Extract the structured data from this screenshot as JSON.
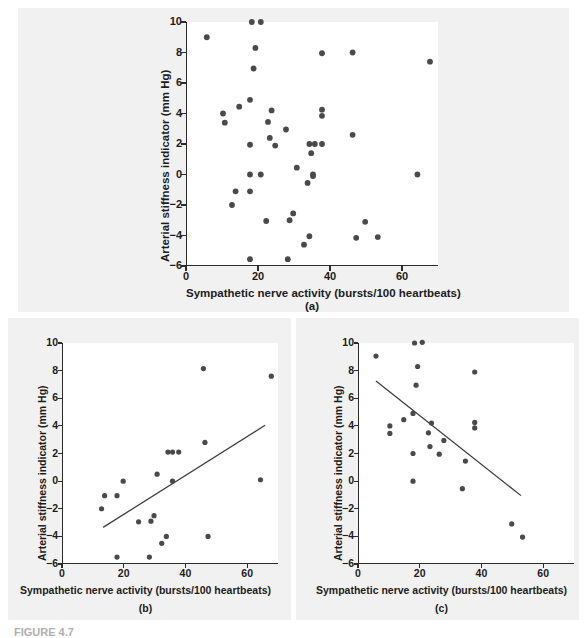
{
  "figure": {
    "caption_label": "FIGURE 4.7",
    "caption_text": "",
    "background_color": "#f1f1f1",
    "plot_background_color": "#ffffff",
    "point_color": "#4a4a4a",
    "axis_color": "#2b2b2b",
    "line_color": "#3a3a3a"
  },
  "axis_titles": {
    "x": "Sympathetic nerve activity (bursts/100 heartbeats)",
    "y": "Arterial stiffness indicator (mm Hg)"
  },
  "ticks": {
    "x": [
      "0",
      "20",
      "40",
      "60"
    ],
    "y": [
      "10",
      "8",
      "6",
      "4",
      "2",
      "0",
      "−2",
      "−4",
      "−6"
    ]
  },
  "panels": [
    {
      "id": "a",
      "letter": "(a)"
    },
    {
      "id": "b",
      "letter": "(b)"
    },
    {
      "id": "c",
      "letter": "(c)"
    }
  ],
  "chart_data": [
    {
      "type": "scatter",
      "panel": "(a)",
      "title": "",
      "xlabel": "Sympathetic nerve activity (bursts/100 heartbeats)",
      "ylabel": "Arterial stiffness indicator (mm Hg)",
      "xlim": [
        0,
        70
      ],
      "ylim": [
        -6,
        10
      ],
      "xticks": [
        0,
        20,
        40,
        60
      ],
      "yticks": [
        -6,
        -4,
        -2,
        0,
        2,
        4,
        6,
        8,
        10
      ],
      "grid": false,
      "legend": null,
      "trendline": null,
      "points": [
        [
          5.5,
          9.0
        ],
        [
          18.0,
          10.0
        ],
        [
          20.5,
          10.0
        ],
        [
          19.0,
          8.3
        ],
        [
          37.5,
          7.95
        ],
        [
          46.0,
          8.0
        ],
        [
          67.5,
          7.4
        ],
        [
          18.5,
          6.95
        ],
        [
          17.5,
          4.9
        ],
        [
          14.5,
          4.45
        ],
        [
          10.0,
          4.0
        ],
        [
          23.5,
          4.2
        ],
        [
          37.5,
          4.25
        ],
        [
          10.5,
          3.4
        ],
        [
          37.5,
          3.85
        ],
        [
          22.5,
          3.45
        ],
        [
          27.5,
          2.95
        ],
        [
          46.0,
          2.6
        ],
        [
          23.0,
          2.4
        ],
        [
          17.5,
          1.95
        ],
        [
          24.5,
          1.9
        ],
        [
          34.0,
          2.0
        ],
        [
          35.5,
          2.0
        ],
        [
          37.5,
          2.0
        ],
        [
          34.5,
          1.4
        ],
        [
          30.5,
          0.45
        ],
        [
          17.5,
          0.0
        ],
        [
          20.5,
          0.0
        ],
        [
          35.0,
          0.0
        ],
        [
          64.0,
          0.0
        ],
        [
          33.5,
          -0.55
        ],
        [
          35.0,
          -0.1
        ],
        [
          13.5,
          -1.1
        ],
        [
          17.5,
          -1.1
        ],
        [
          12.5,
          -2.0
        ],
        [
          29.5,
          -2.55
        ],
        [
          22.0,
          -3.05
        ],
        [
          28.5,
          -3.0
        ],
        [
          49.5,
          -3.1
        ],
        [
          34.0,
          -4.05
        ],
        [
          47.0,
          -4.15
        ],
        [
          53.0,
          -4.1
        ],
        [
          32.5,
          -4.6
        ],
        [
          17.5,
          -5.55
        ],
        [
          28.0,
          -5.55
        ]
      ]
    },
    {
      "type": "scatter",
      "panel": "(b)",
      "title": "",
      "xlabel": "Sympathetic nerve activity (bursts/100 heartbeats)",
      "ylabel": "Arterial stiffness indicator (mm Hg)",
      "xlim": [
        0,
        70
      ],
      "ylim": [
        -6,
        10
      ],
      "xticks": [
        0,
        20,
        40,
        60
      ],
      "yticks": [
        -6,
        -4,
        -2,
        0,
        2,
        4,
        6,
        8,
        10
      ],
      "grid": false,
      "legend": null,
      "trendline": {
        "x0": 13.0,
        "y0": -3.35,
        "x1": 65.5,
        "y1": 4.05
      },
      "points": [
        [
          45.5,
          8.15
        ],
        [
          67.5,
          7.6
        ],
        [
          46.0,
          2.8
        ],
        [
          34.0,
          2.1
        ],
        [
          35.5,
          2.1
        ],
        [
          37.5,
          2.1
        ],
        [
          30.5,
          0.5
        ],
        [
          19.5,
          0.0
        ],
        [
          35.5,
          0.0
        ],
        [
          64.0,
          0.1
        ],
        [
          13.5,
          -1.05
        ],
        [
          17.5,
          -1.05
        ],
        [
          12.5,
          -2.0
        ],
        [
          29.5,
          -2.5
        ],
        [
          24.5,
          -2.95
        ],
        [
          28.5,
          -2.9
        ],
        [
          33.5,
          -4.0
        ],
        [
          47.0,
          -4.0
        ],
        [
          32.0,
          -4.5
        ],
        [
          17.5,
          -5.5
        ],
        [
          28.0,
          -5.5
        ]
      ]
    },
    {
      "type": "scatter",
      "panel": "(c)",
      "title": "",
      "xlabel": "Sympathetic nerve activity (bursts/100 heartbeats)",
      "ylabel": "Arterial stiffness indicator (mm Hg)",
      "xlim": [
        0,
        70
      ],
      "ylim": [
        -6,
        10
      ],
      "xticks": [
        0,
        20,
        40,
        60
      ],
      "yticks": [
        -6,
        -4,
        -2,
        0,
        2,
        4,
        6,
        8,
        10
      ],
      "grid": false,
      "legend": null,
      "trendline": {
        "x0": 5.5,
        "y0": 7.25,
        "x1": 52.5,
        "y1": -1.05
      },
      "points": [
        [
          5.5,
          9.05
        ],
        [
          18.0,
          10.0
        ],
        [
          20.5,
          10.05
        ],
        [
          19.0,
          8.3
        ],
        [
          37.5,
          7.9
        ],
        [
          18.5,
          6.95
        ],
        [
          17.5,
          4.9
        ],
        [
          14.5,
          4.45
        ],
        [
          10.0,
          4.0
        ],
        [
          23.5,
          4.2
        ],
        [
          37.5,
          4.25
        ],
        [
          10.0,
          3.45
        ],
        [
          37.5,
          3.85
        ],
        [
          22.5,
          3.5
        ],
        [
          27.5,
          2.95
        ],
        [
          23.0,
          2.5
        ],
        [
          17.5,
          2.0
        ],
        [
          26.0,
          1.95
        ],
        [
          34.5,
          1.45
        ],
        [
          17.5,
          0.0
        ],
        [
          33.5,
          -0.55
        ],
        [
          49.5,
          -3.1
        ],
        [
          53.0,
          -4.05
        ]
      ]
    }
  ]
}
